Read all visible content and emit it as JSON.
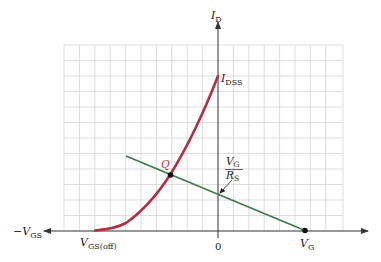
{
  "diagram": {
    "type": "JFET transfer characteristic with self-bias load line",
    "colors": {
      "grid": "#d4d4d4",
      "axis": "#333333",
      "transfer_curve": "#b0303f",
      "load_line": "#3e7a45",
      "point": "#111111",
      "q_label": "#c0303f"
    },
    "axes": {
      "y_axis": {
        "label_main": "I",
        "label_sub": "D"
      },
      "x_axis_negative": {
        "label_prefix": "−",
        "label_main": "V",
        "label_sub": "GS"
      },
      "origin_label": "0"
    },
    "labels": {
      "idss": {
        "main": "I",
        "sub": "DSS"
      },
      "vgs_off": {
        "main": "V",
        "sub": "GS(off)"
      },
      "q_point": "Q",
      "vg_over_rs": {
        "num_main": "V",
        "num_sub": "G",
        "den_main": "R",
        "den_sub": "S"
      },
      "vg": {
        "main": "V",
        "sub": "G"
      }
    },
    "grid": {
      "columns": 18,
      "rows": 12
    }
  }
}
